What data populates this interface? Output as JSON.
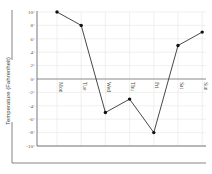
{
  "chart_data": {
    "type": "line",
    "title": "",
    "xlabel": "",
    "ylabel": "Temperature (Fahrenheit)",
    "categories": [
      "Mon",
      "Tue",
      "Wed",
      "Thu",
      "Fri",
      "Sat",
      "Sun"
    ],
    "series": [
      {
        "name": "Temperature",
        "values": [
          10,
          8,
          -5,
          -3,
          -8,
          5,
          7
        ]
      }
    ],
    "ylim": [
      -10,
      10
    ],
    "yticks": [
      "10°",
      "8°",
      "6°",
      "4°",
      "2°",
      "0°",
      "-2°",
      "-4°",
      "-6°",
      "-8°",
      "-10°"
    ],
    "grid": true,
    "legend": "none",
    "colors": {
      "line": "#333333",
      "marker": "#111111",
      "grid": "#e6e6e6",
      "axis": "#555555"
    }
  }
}
